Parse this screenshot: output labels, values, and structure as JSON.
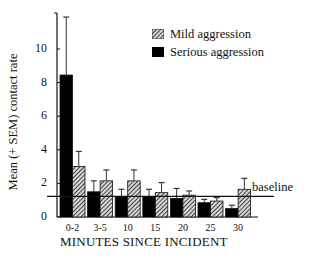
{
  "chart_data": {
    "type": "bar",
    "title": "",
    "xlabel": "MINUTES SINCE INCIDENT",
    "ylabel": "Mean (+ SEM) contact rate",
    "categories": [
      "0-2",
      "3-5",
      "10",
      "15",
      "20",
      "25",
      "30"
    ],
    "series": [
      {
        "name": "Serious aggression",
        "fill": "solid",
        "color": "#000000",
        "values": [
          8.45,
          1.5,
          1.2,
          1.2,
          1.1,
          0.85,
          0.5
        ],
        "error_top": [
          11.9,
          2.15,
          1.65,
          1.65,
          1.7,
          1.05,
          0.7
        ]
      },
      {
        "name": "Mild aggression",
        "fill": "hatched",
        "color": "#555555",
        "values": [
          3.0,
          2.15,
          2.15,
          1.45,
          1.3,
          0.95,
          1.65
        ],
        "error_top": [
          3.9,
          2.8,
          2.8,
          2.05,
          1.55,
          1.15,
          2.3
        ]
      }
    ],
    "yticks": [
      0,
      2,
      4,
      6,
      8,
      10
    ],
    "ylim": [
      0,
      12
    ],
    "grid": false,
    "legend_position": "top-right",
    "reference_line": {
      "label": "baseline",
      "value": 1.2
    }
  },
  "labels": {
    "ylabel": "Mean (+ SEM) contact rate",
    "xlabel": "MINUTES SINCE INCIDENT",
    "baseline": "baseline",
    "legend_mild": "Mild aggression",
    "legend_serious": "Serious aggression",
    "yticks": [
      "0",
      "2",
      "4",
      "6",
      "8",
      "10"
    ],
    "xticks": [
      "0-2",
      "3-5",
      "10",
      "15",
      "20",
      "25",
      "30"
    ]
  }
}
